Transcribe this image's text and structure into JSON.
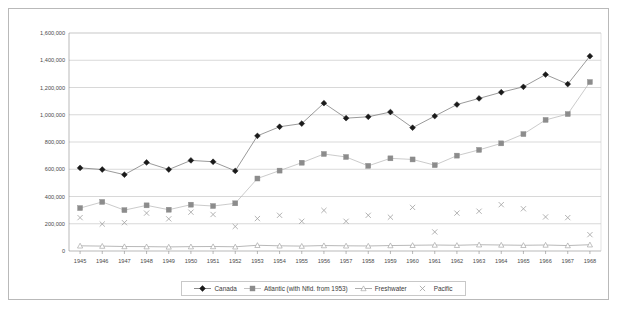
{
  "chart_data": {
    "type": "line",
    "title": "",
    "xlabel": "",
    "ylabel": "",
    "ylim": [
      0,
      1600000
    ],
    "ytick_step": 200000,
    "grid": true,
    "legend_position": "bottom",
    "categories": [
      "1945",
      "1946",
      "1947",
      "1948",
      "1949",
      "1950",
      "1951",
      "1952",
      "1953",
      "1954",
      "1955",
      "1956",
      "1957",
      "1958",
      "1959",
      "1960",
      "1961",
      "1962",
      "1963",
      "1964",
      "1965",
      "1966",
      "1967",
      "1968"
    ],
    "ytick_labels": [
      "0",
      "200,000",
      "400,000",
      "600,000",
      "800,000",
      "1,000,000",
      "1,200,000",
      "1,400,000",
      "1,600,000"
    ],
    "series": [
      {
        "name": "Canada",
        "marker": "diamond",
        "color": "#1a1a1a",
        "line_color": "#6f6f6f",
        "values": [
          610000,
          598000,
          560000,
          650000,
          598000,
          665000,
          655000,
          588000,
          845000,
          912000,
          935000,
          1085000,
          975000,
          985000,
          1020000,
          905000,
          990000,
          1075000,
          1120000,
          1165000,
          1205000,
          1295000,
          1225000,
          1430000
        ]
      },
      {
        "name": "Atlantic (with Nfld. from 1953)",
        "marker": "square",
        "color": "#8c8c8c",
        "line_color": "#b5b5b5",
        "values": [
          315000,
          360000,
          300000,
          335000,
          303000,
          340000,
          330000,
          350000,
          532000,
          590000,
          648000,
          712000,
          690000,
          625000,
          680000,
          672000,
          630000,
          700000,
          742000,
          790000,
          858000,
          962000,
          1005000,
          1240000
        ]
      },
      {
        "name": "Freshwater",
        "marker": "triangle",
        "color": "#9a9a9a",
        "line_color": "#9a9a9a",
        "values": [
          38000,
          36000,
          33000,
          32000,
          30000,
          32000,
          33000,
          31000,
          42000,
          38000,
          36000,
          40000,
          38000,
          37000,
          40000,
          42000,
          44000,
          42000,
          46000,
          44000,
          42000,
          44000,
          40000,
          46000
        ]
      },
      {
        "name": "Pacific",
        "marker": "cross",
        "color": "#a0a0a0",
        "line_color": "none",
        "values": [
          245000,
          198000,
          208000,
          278000,
          236000,
          285000,
          268000,
          180000,
          238000,
          262000,
          218000,
          298000,
          218000,
          262000,
          248000,
          320000,
          140000,
          278000,
          292000,
          340000,
          310000,
          250000,
          245000,
          120000
        ]
      }
    ]
  },
  "legend": {
    "items": [
      {
        "label": "Canada"
      },
      {
        "label": "Atlantic (with Nfld. from 1953)"
      },
      {
        "label": "Freshwater"
      },
      {
        "label": "Pacific"
      }
    ]
  }
}
